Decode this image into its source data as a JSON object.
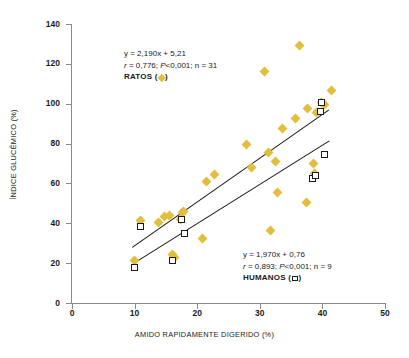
{
  "figure": {
    "title": "",
    "marker_color_rats": "#E3BE3C",
    "marker_color_humans": "#FFFFFF",
    "line_color": "#141414",
    "axis_color": "#8A8A8A"
  },
  "axes": {
    "x_title": "AMIDO RAPIDAMENTE DIGERIDO (%)",
    "y_title": "ÍNDICE GLUCÊMICO (%)",
    "x_ticks": [
      "0",
      "10",
      "20",
      "30",
      "40",
      "50"
    ],
    "y_ticks": [
      "0",
      "20",
      "40",
      "60",
      "80",
      "100",
      "120",
      "140"
    ]
  },
  "annotations": {
    "rats": {
      "equation": "y = 2,190x + 5,21",
      "stats_r": "r",
      "stats_rest": " = 0,776; ",
      "stats_p": "P",
      "stats_tail": "<0,001; n = 31",
      "legend_label": "RATOS (",
      "legend_close": ")"
    },
    "humans": {
      "equation": "y = 1,970x + 0,76",
      "stats_r": "r",
      "stats_rest": " = 0,893; ",
      "stats_p": "P",
      "stats_tail": "<0,001; n = 9",
      "legend_label": "HUMANOS (",
      "legend_close": ")"
    }
  },
  "chart_data": {
    "type": "scatter",
    "title": "",
    "xlabel": "AMIDO RAPIDAMENTE DIGERIDO (%)",
    "ylabel": "ÍNDICE GLUCÊMICO (%)",
    "xlim": [
      0,
      50
    ],
    "ylim": [
      0,
      140
    ],
    "xticks": [
      0,
      10,
      20,
      30,
      40,
      50
    ],
    "yticks": [
      0,
      20,
      40,
      60,
      80,
      100,
      120,
      140
    ],
    "grid": false,
    "legend_position": "in-plot",
    "series": [
      {
        "name": "RATOS",
        "marker": "diamond",
        "color": "#E3BE3C",
        "n": 31,
        "fit": {
          "equation": "y = 2,190x + 5,21",
          "slope": 2.19,
          "intercept": 5.21,
          "r": 0.776,
          "p": "<0,001",
          "x_start": 9.6,
          "x_end": 41.0,
          "y_start": 28.0,
          "y_end": 97.0
        },
        "points": [
          [
            10.0,
            21.5
          ],
          [
            11.0,
            41.5
          ],
          [
            13.8,
            40.5
          ],
          [
            14.8,
            43.5
          ],
          [
            15.6,
            44.0
          ],
          [
            16.0,
            24.5
          ],
          [
            16.3,
            23.0
          ],
          [
            17.3,
            42.0
          ],
          [
            17.6,
            45.5
          ],
          [
            17.8,
            46.0
          ],
          [
            20.8,
            32.5
          ],
          [
            21.5,
            61.0
          ],
          [
            22.7,
            64.5
          ],
          [
            27.9,
            79.5
          ],
          [
            28.6,
            68.0
          ],
          [
            30.8,
            116.0
          ],
          [
            31.4,
            75.5
          ],
          [
            31.7,
            36.5
          ],
          [
            32.5,
            71.0
          ],
          [
            32.9,
            55.5
          ],
          [
            33.6,
            87.5
          ],
          [
            35.7,
            92.5
          ],
          [
            36.3,
            129.0
          ],
          [
            37.4,
            50.5
          ],
          [
            37.6,
            97.5
          ],
          [
            38.5,
            70.0
          ],
          [
            38.8,
            65.0
          ],
          [
            39.0,
            95.5
          ],
          [
            39.8,
            100.5
          ],
          [
            40.3,
            99.5
          ],
          [
            41.5,
            106.5
          ]
        ]
      },
      {
        "name": "HUMANOS",
        "marker": "square",
        "color": "#FFFFFF",
        "n": 9,
        "fit": {
          "equation": "y = 1,970x + 0,76",
          "slope": 1.97,
          "intercept": 0.76,
          "r": 0.893,
          "p": "<0,001",
          "x_start": 10.0,
          "x_end": 41.0,
          "y_start": 20.5,
          "y_end": 81.5
        },
        "points": [
          [
            10.0,
            18.0
          ],
          [
            11.0,
            38.5
          ],
          [
            16.0,
            21.5
          ],
          [
            17.5,
            42.0
          ],
          [
            17.9,
            35.0
          ],
          [
            38.4,
            62.5
          ],
          [
            38.9,
            64.0
          ],
          [
            39.7,
            96.0
          ],
          [
            39.9,
            100.5
          ],
          [
            40.4,
            74.5
          ]
        ]
      }
    ]
  }
}
